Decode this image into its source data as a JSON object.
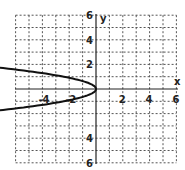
{
  "chart_data": {
    "type": "line",
    "title": "",
    "xlabel": "x",
    "ylabel": "y",
    "xlim": [
      -6,
      6
    ],
    "ylim": [
      -6,
      6
    ],
    "grid": true,
    "x_tick_labels": [
      "-4",
      "-2",
      "2",
      "4",
      "6"
    ],
    "y_tick_labels": [
      "6",
      "4",
      "2",
      "4",
      "6"
    ],
    "series": [
      {
        "name": "parabola opening left",
        "equation": "x = -2.5y^2",
        "vertex": [
          0,
          0
        ],
        "points": [
          [
            -7,
            1.7
          ],
          [
            -4,
            1.3
          ],
          [
            -2,
            0.9
          ],
          [
            0,
            0
          ],
          [
            -2,
            -0.9
          ],
          [
            -4,
            -1.3
          ],
          [
            -7,
            -1.7
          ]
        ]
      }
    ]
  },
  "axes": {
    "x_label": "x",
    "y_label": "y"
  }
}
